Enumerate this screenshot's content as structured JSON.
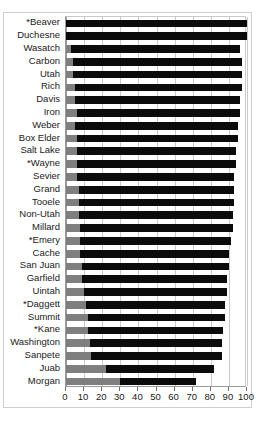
{
  "chart_data": {
    "type": "bar",
    "orientation": "horizontal",
    "stacked": true,
    "title": "",
    "xlabel": "",
    "ylabel": "",
    "xlim": [
      0,
      100
    ],
    "xticks": [
      0,
      10,
      20,
      30,
      40,
      50,
      60,
      70,
      80,
      90,
      100
    ],
    "xticklabels": [
      "0",
      "10",
      "20",
      "30",
      "40",
      "50",
      "60",
      "70",
      "80",
      "90",
      "100"
    ],
    "grid": true,
    "legend": "none",
    "categories": [
      "*Beaver",
      "Duchesne",
      "Wasatch",
      "Carbon",
      "Utah",
      "Rich",
      "Davis",
      "Iron",
      "Weber",
      "Box Elder",
      "Salt Lake",
      "*Wayne",
      "Sevier",
      "Grand",
      "Tooele",
      "Non-Utah",
      "Millard",
      "*Emery",
      "Cache",
      "San Juan",
      "Garfield",
      "Uintah",
      "*Daggett",
      "Summit",
      "*Kane",
      "Washington",
      "Sanpete",
      "Juab",
      "Morgan"
    ],
    "series": [
      {
        "name": "lower-segment",
        "color": "#7f7f7f",
        "values": [
          0,
          0,
          3,
          4,
          4,
          5,
          5,
          6,
          5,
          6,
          6,
          6,
          6,
          7,
          7,
          7,
          8,
          8,
          8,
          9,
          9,
          10,
          11,
          12,
          12,
          13,
          14,
          22,
          30
        ]
      },
      {
        "name": "upper-segment",
        "color": "#0b0b0b",
        "values": [
          100,
          100,
          93,
          93,
          93,
          92,
          91,
          90,
          90,
          89,
          88,
          88,
          87,
          86,
          86,
          85,
          84,
          83,
          82,
          81,
          80,
          79,
          77,
          76,
          75,
          73,
          72,
          60,
          42
        ]
      }
    ],
    "totals": [
      100,
      100,
      96,
      97,
      97,
      97,
      96,
      96,
      95,
      95,
      94,
      94,
      93,
      93,
      93,
      92,
      92,
      91,
      90,
      90,
      89,
      89,
      88,
      88,
      87,
      86,
      86,
      82,
      72
    ]
  }
}
